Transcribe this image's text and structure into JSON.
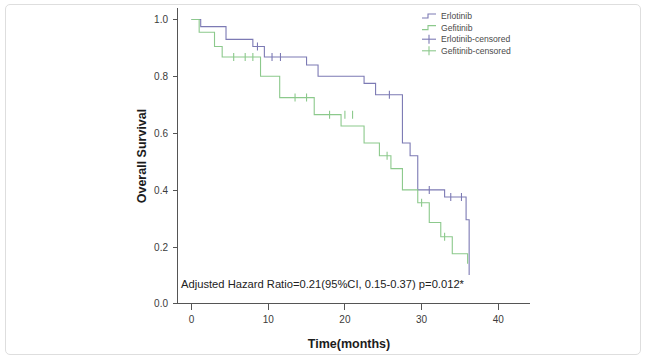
{
  "chart_data": {
    "type": "line",
    "plot_kind": "kaplan-meier-survival",
    "title": "",
    "xlabel": "Time(months)",
    "ylabel": "Overall Survival",
    "xlim": [
      -2,
      44
    ],
    "ylim": [
      0.0,
      1.04
    ],
    "xticks": [
      0,
      10,
      20,
      30,
      40
    ],
    "xtick_labels": [
      "0",
      "10",
      "20",
      "30",
      "40"
    ],
    "yticks": [
      0.0,
      0.2,
      0.4,
      0.6,
      0.8,
      1.0
    ],
    "ytick_labels": [
      "0.0",
      "0.2",
      "0.4",
      "0.6",
      "0.8",
      "1.0"
    ],
    "grid": false,
    "legend_position": "top-right",
    "annotation": "Adjusted Hazard Ratio=0.21(95%CI, 0.15-0.37) p=0.012*",
    "colors": {
      "erlotinib": "#7c7ab4",
      "gefitinib": "#8cc98c",
      "axis": "#555555",
      "text": "#333333",
      "frame": "#dedede"
    },
    "series": [
      {
        "name": "Erlotinib",
        "color": "#7c7ab4",
        "steps": [
          [
            0,
            1.0
          ],
          [
            1.2,
            1.0
          ],
          [
            1.2,
            0.975
          ],
          [
            4.5,
            0.975
          ],
          [
            4.5,
            0.93
          ],
          [
            8.0,
            0.93
          ],
          [
            8.0,
            0.905
          ],
          [
            9.5,
            0.905
          ],
          [
            9.5,
            0.868
          ],
          [
            15.0,
            0.868
          ],
          [
            15.0,
            0.84
          ],
          [
            16.5,
            0.84
          ],
          [
            16.5,
            0.8
          ],
          [
            22.5,
            0.8
          ],
          [
            22.5,
            0.775
          ],
          [
            24.0,
            0.775
          ],
          [
            24.0,
            0.735
          ],
          [
            27.5,
            0.735
          ],
          [
            27.5,
            0.565
          ],
          [
            28.5,
            0.565
          ],
          [
            28.5,
            0.52
          ],
          [
            29.5,
            0.52
          ],
          [
            29.5,
            0.4
          ],
          [
            33.0,
            0.4
          ],
          [
            33.0,
            0.375
          ],
          [
            35.8,
            0.375
          ],
          [
            35.8,
            0.295
          ],
          [
            36.2,
            0.295
          ],
          [
            36.2,
            0.1
          ]
        ],
        "censored": [
          [
            8.6,
            0.905
          ],
          [
            10.5,
            0.868
          ],
          [
            11.6,
            0.868
          ],
          [
            25.8,
            0.735
          ],
          [
            31.0,
            0.4
          ],
          [
            33.8,
            0.375
          ],
          [
            35.2,
            0.375
          ]
        ]
      },
      {
        "name": "Gefitinib",
        "color": "#8cc98c",
        "steps": [
          [
            0,
            1.0
          ],
          [
            1.0,
            1.0
          ],
          [
            1.0,
            0.955
          ],
          [
            3.0,
            0.955
          ],
          [
            3.0,
            0.905
          ],
          [
            4.0,
            0.905
          ],
          [
            4.0,
            0.868
          ],
          [
            9.0,
            0.868
          ],
          [
            9.0,
            0.8
          ],
          [
            11.5,
            0.8
          ],
          [
            11.5,
            0.725
          ],
          [
            16.0,
            0.725
          ],
          [
            16.0,
            0.665
          ],
          [
            19.5,
            0.665
          ],
          [
            19.5,
            0.625
          ],
          [
            22.5,
            0.625
          ],
          [
            22.5,
            0.565
          ],
          [
            24.5,
            0.565
          ],
          [
            24.5,
            0.52
          ],
          [
            26.0,
            0.52
          ],
          [
            26.0,
            0.475
          ],
          [
            27.5,
            0.475
          ],
          [
            27.5,
            0.4
          ],
          [
            29.5,
            0.4
          ],
          [
            29.5,
            0.355
          ],
          [
            31.0,
            0.355
          ],
          [
            31.0,
            0.285
          ],
          [
            32.5,
            0.285
          ],
          [
            32.5,
            0.235
          ],
          [
            34.0,
            0.235
          ],
          [
            34.0,
            0.175
          ],
          [
            36.0,
            0.175
          ],
          [
            36.0,
            0.14
          ]
        ],
        "censored": [
          [
            5.5,
            0.868
          ],
          [
            7.0,
            0.868
          ],
          [
            8.0,
            0.868
          ],
          [
            13.5,
            0.725
          ],
          [
            15.0,
            0.725
          ],
          [
            18.0,
            0.665
          ],
          [
            20.0,
            0.665
          ],
          [
            21.0,
            0.665
          ],
          [
            25.5,
            0.52
          ],
          [
            30.0,
            0.355
          ],
          [
            33.0,
            0.235
          ]
        ]
      }
    ],
    "legend": [
      {
        "label": "Erlotinib",
        "color": "#7c7ab4",
        "marker": "step-line"
      },
      {
        "label": "Gefitinib",
        "color": "#8cc98c",
        "marker": "step-line"
      },
      {
        "label": "Erlotinib-censored",
        "color": "#7c7ab4",
        "marker": "plus-cross"
      },
      {
        "label": "Gefitinib-censored",
        "color": "#8cc98c",
        "marker": "plus-cross"
      }
    ]
  }
}
